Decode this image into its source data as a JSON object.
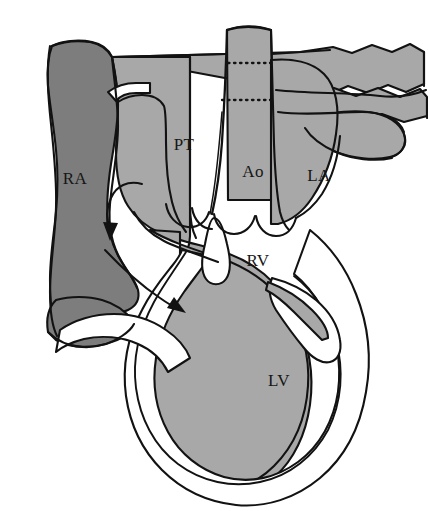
{
  "figure": {
    "background_color": "#ffffff",
    "outline_color": "#121212",
    "width": 428,
    "height": 511
  },
  "palette": {
    "deoxygenated_gray": "#7d7d7d",
    "oxygenated_gray": "#a8a8a8",
    "myocardium_white": "#ffffff",
    "outline": "#121212",
    "label_color": "#161616"
  },
  "labels": [
    {
      "id": "RA",
      "text": "RA",
      "full_name": "right atrium",
      "x": 75,
      "y": 180,
      "region": "deoxygenated"
    },
    {
      "id": "PT",
      "text": "PT",
      "full_name": "pulmonary trunk",
      "x": 184,
      "y": 146,
      "region": "oxygenated"
    },
    {
      "id": "Ao",
      "text": "Ao",
      "full_name": "aorta",
      "x": 253,
      "y": 173,
      "region": "oxygenated"
    },
    {
      "id": "LA",
      "text": "LA",
      "full_name": "left atrium",
      "x": 319,
      "y": 177,
      "region": "oxygenated"
    },
    {
      "id": "RV",
      "text": "RV",
      "full_name": "right ventricle",
      "x": 258,
      "y": 262,
      "region": "oxygenated"
    },
    {
      "id": "LV",
      "text": "LV",
      "full_name": "left ventricle",
      "x": 279,
      "y": 382,
      "region": "oxygenated"
    }
  ],
  "annotations": {
    "flow_arrows": [
      {
        "id": "arrow-upper",
        "description": "curved blood-flow arrow from right atrium downward into right ventricle inflow"
      },
      {
        "id": "arrow-lower",
        "description": "curved blood-flow arrow from inferior vena cava sweeping right toward the ventricle"
      }
    ],
    "dotted_lines": [
      {
        "id": "dotted-line-upper",
        "description": "dashed line across the aorta where the right pulmonary artery passes behind",
        "y": 63
      },
      {
        "id": "dotted-line-lower",
        "description": "dashed line across the aorta where the pulmonary vein passes behind",
        "y": 100
      }
    ],
    "valve_cusps": {
      "id": "semilunar-valve-cusps",
      "description": "scalloped semilunar valve cusps at the ventricular outflow tracts"
    },
    "valve_leaflet": {
      "id": "aortic-valve-leaflet",
      "description": "white teardrop-shaped valve leaflet below the aortic root"
    }
  }
}
